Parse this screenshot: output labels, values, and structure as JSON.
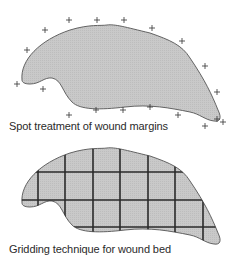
{
  "panels": [
    {
      "id": "spot-treatment",
      "caption": "Spot treatment of wound margins",
      "technique": "spot treatment",
      "marker": "+",
      "marker_count": 19
    },
    {
      "id": "gridding",
      "caption": "Gridding technique for wound bed",
      "technique": "grid",
      "grid_columns": 7,
      "grid_rows": 4
    }
  ],
  "colors": {
    "wound_fill": "#c8c8c8",
    "wound_outline": "#555555",
    "grid_line": "#2a2a2a",
    "marker": "#333333"
  }
}
